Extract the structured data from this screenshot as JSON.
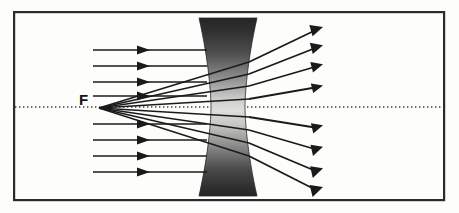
{
  "figure": {
    "kind": "optics-ray-diagram",
    "background_color": "#fdfdfb",
    "ink_color": "#1a1a1a"
  },
  "frame": {
    "label": "figure-border",
    "x": 13,
    "y": 11,
    "width": 432,
    "height": 190,
    "stroke_color": "#2b2b2b",
    "stroke_width": 2.2,
    "fill_color": "#fdfdfb"
  },
  "optical_axis": {
    "label": "principal axis",
    "y": 107,
    "x_start": 15,
    "x_end": 443,
    "style": "dotted",
    "color": "#333333",
    "dash": "1.4 2.6",
    "stroke_width": 1.2
  },
  "focal_point": {
    "label": "F",
    "meaning": "virtual focal point",
    "x": 98,
    "y": 108,
    "label_x": 79,
    "label_y": 92,
    "color": "#141414"
  },
  "lens": {
    "name": "biconcave diverging lens",
    "type": "concave",
    "center_x": 228,
    "top_y": 18,
    "bottom_y": 196,
    "half_width_edge": 29,
    "half_width_waist": 17,
    "edge_color": "#262626",
    "shade_dark": "#2e2e2e",
    "shade_mid": "#8c8c8c",
    "shade_light": "#d8d8d6"
  },
  "incoming_rays": {
    "label": "incident parallel rays",
    "direction": "left-to-right",
    "x_start": 93,
    "x_end": 207,
    "arrow_x": 146,
    "color": "#1a1a1a",
    "stroke_width": 1.5,
    "y_values": [
      50,
      66,
      82,
      96,
      124,
      140,
      156,
      172
    ]
  },
  "refracted_rays": {
    "label": "refracted diverging rays",
    "note": "each emerges from the lens and spreads away from the axis",
    "x_lens_exit": 249,
    "x_end": 322,
    "color": "#1a1a1a",
    "stroke_width": 1.8,
    "end_y_values": [
      29,
      47,
      66,
      87,
      128,
      150,
      172,
      191
    ]
  },
  "virtual_rays": {
    "label": "backward extensions to focal point F",
    "note": "dotted construction lines drawn from F through the lens",
    "color": "#1a1a1a",
    "stroke_width": 1.4
  },
  "arrowheads": {
    "label": "ray direction arrowheads",
    "style": "solid-filled-triangle",
    "length": 9,
    "half_width": 3.6,
    "color": "#1a1a1a"
  }
}
